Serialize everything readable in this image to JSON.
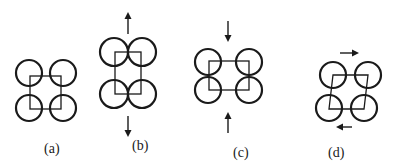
{
  "figure": {
    "panels": [
      {
        "id": "a",
        "label": "(a)",
        "motion": "none"
      },
      {
        "id": "b",
        "label": "(b)",
        "motion": "vertical-stretch",
        "arrows": [
          "up-arrow",
          "down-arrow"
        ]
      },
      {
        "id": "c",
        "label": "(c)",
        "motion": "vertical-compression",
        "arrows": [
          "down-arrow",
          "up-arrow"
        ]
      },
      {
        "id": "d",
        "label": "(d)",
        "motion": "shear",
        "arrows": [
          "right-arrow",
          "left-arrow"
        ]
      }
    ],
    "colors": {
      "stroke": "#1a1a1a",
      "background": "#ffffff"
    }
  }
}
